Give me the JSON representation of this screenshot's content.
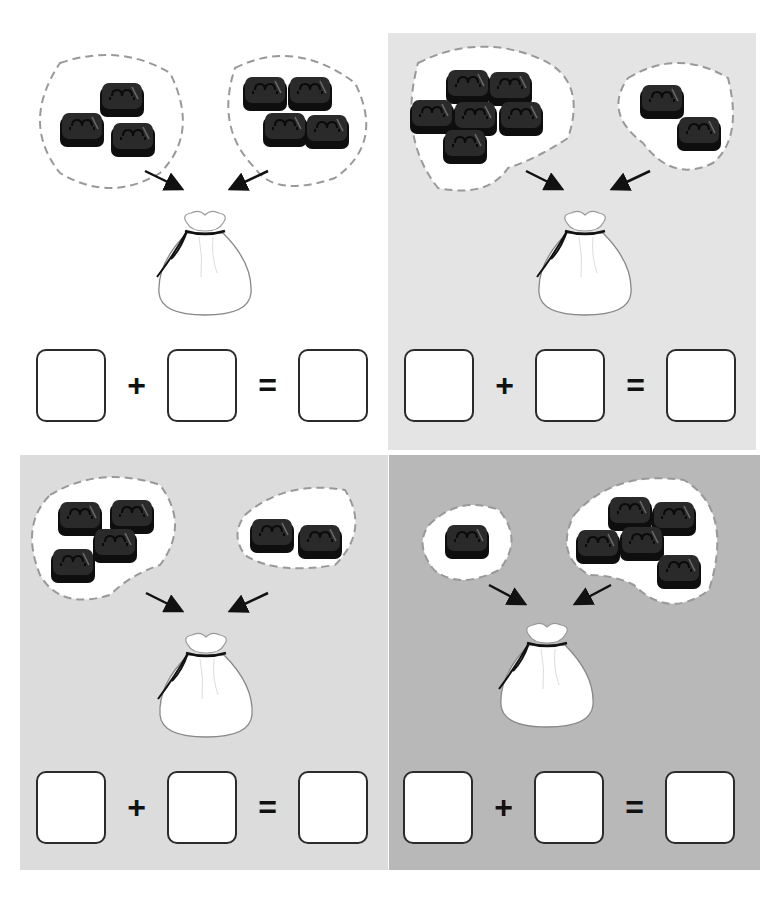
{
  "worksheet": {
    "panels": [
      {
        "id": "top-left",
        "background": "#ffffff",
        "left_group_count": 3,
        "right_group_count": 4,
        "equation": {
          "plus": "+",
          "equals": "=",
          "addend1": "",
          "addend2": "",
          "sum": ""
        }
      },
      {
        "id": "top-right",
        "background": "#e4e4e4",
        "left_group_count": 6,
        "right_group_count": 2,
        "equation": {
          "plus": "+",
          "equals": "=",
          "addend1": "",
          "addend2": "",
          "sum": ""
        }
      },
      {
        "id": "bottom-left",
        "background": "#dcdcdc",
        "left_group_count": 4,
        "right_group_count": 2,
        "equation": {
          "plus": "+",
          "equals": "=",
          "addend1": "",
          "addend2": "",
          "sum": ""
        }
      },
      {
        "id": "bottom-right",
        "background": "#b8b8b8",
        "left_group_count": 1,
        "right_group_count": 5,
        "equation": {
          "plus": "+",
          "equals": "=",
          "addend1": "",
          "addend2": "",
          "sum": ""
        }
      }
    ],
    "icons": {
      "candy": "candy-icon",
      "bag": "drawstring-bag-icon",
      "arrow": "arrow-icon"
    },
    "colors": {
      "candy": "#1a1a1a",
      "dashed_outline": "#999999",
      "box_border": "#2b2b2b"
    }
  }
}
